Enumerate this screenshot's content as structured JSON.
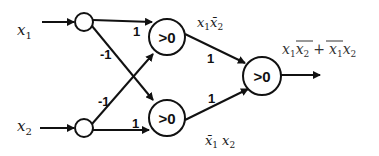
{
  "diagram": {
    "type": "neural-network-xor",
    "inputs": [
      {
        "id": "x1",
        "label_base": "x",
        "label_sub": "1"
      },
      {
        "id": "x2",
        "label_base": "x",
        "label_sub": "2"
      }
    ],
    "hidden_nodes": [
      {
        "id": "h1",
        "text": ">0",
        "annotation_base1": "x",
        "annotation_sub1": "1",
        "annotation_base2": "x̄",
        "annotation_sub2": "2"
      },
      {
        "id": "h2",
        "text": ">0",
        "annotation_base1": "x̄",
        "annotation_sub1": "1",
        "annotation_base2": "x",
        "annotation_sub2": "2"
      }
    ],
    "output_node": {
      "id": "out",
      "text": ">0"
    },
    "output_expression": {
      "term1_a": "x",
      "term1_a_sub": "1",
      "term1_b": "x",
      "term1_b_sub": "2",
      "plus": "+",
      "term2_a": "x",
      "term2_a_sub": "1",
      "term2_b": "x",
      "term2_b_sub": "2"
    },
    "weights": {
      "x1_h1": "1",
      "x1_h2": "-1",
      "x2_h1": "-1",
      "x2_h2": "1",
      "h1_out": "1",
      "h2_out": "1"
    },
    "colors": {
      "stroke": "#111111",
      "background": "#ffffff"
    }
  }
}
